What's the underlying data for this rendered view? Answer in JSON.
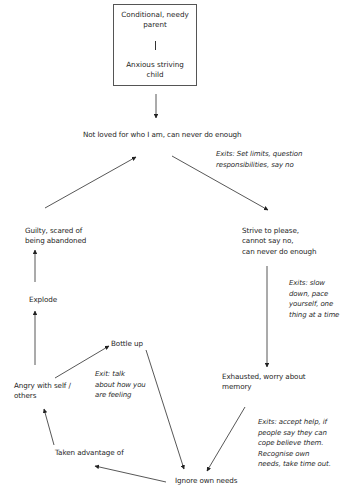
{
  "origin": {
    "top": "Conditional, needy parent",
    "top_line1": "Conditional, needy",
    "top_line2": "parent",
    "bottom_line1": "Anxious striving",
    "bottom_line2": "child"
  },
  "nodes": {
    "core_belief": "Not loved for who I am, can never do enough",
    "strive_l1": "Strive to please,",
    "strive_l2": "cannot say no,",
    "strive_l3": "can never do enough",
    "exhausted_l1": "Exhausted, worry about",
    "exhausted_l2": "memory",
    "ignore": "Ignore own needs",
    "taken": "Taken advantage of",
    "angry_l1": "Angry with self /",
    "angry_l2": "others",
    "bottle": "Bottle up",
    "explode": "Explode",
    "guilty_l1": "Guilty, scared of",
    "guilty_l2": "being abandoned"
  },
  "exits": {
    "core_l1": "Exits: Set limits, question",
    "core_l2": "responsibilities, say no",
    "strive_l1": "Exits: slow",
    "strive_l2": "down, pace",
    "strive_l3": "yourself, one",
    "strive_l4": "thing at a time",
    "exhausted_l1": "Exits: accept help, if",
    "exhausted_l2": "people say they can",
    "exhausted_l3": "cope believe them.",
    "exhausted_l4": "Recognise own",
    "exhausted_l5": "needs, take time out.",
    "angry_l1": "Exit: talk",
    "angry_l2": "about how you",
    "angry_l3": "are feeling"
  },
  "edges": [
    {
      "from": "origin",
      "to": "core_belief"
    },
    {
      "from": "core_belief",
      "to": "strive"
    },
    {
      "from": "strive",
      "to": "exhausted"
    },
    {
      "from": "exhausted",
      "to": "ignore"
    },
    {
      "from": "bottle",
      "to": "ignore"
    },
    {
      "from": "ignore",
      "to": "taken"
    },
    {
      "from": "taken",
      "to": "angry"
    },
    {
      "from": "angry",
      "to": "bottle"
    },
    {
      "from": "angry",
      "to": "explode"
    },
    {
      "from": "explode",
      "to": "guilty"
    },
    {
      "from": "guilty",
      "to": "core_belief"
    }
  ],
  "colors": {
    "line": "#333333",
    "text": "#1e1e1e",
    "background": "#ffffff"
  }
}
